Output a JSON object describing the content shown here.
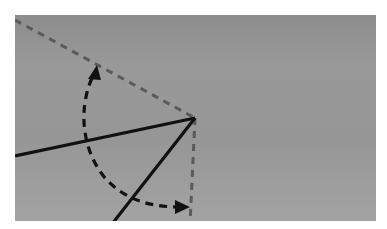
{
  "diagram": {
    "colors": {
      "background": "#ffffff",
      "panel": "#969696",
      "solid_line": "#111111",
      "dashed_reference": "#5a5a5a",
      "arc": "#111111"
    },
    "vertex": [
      195,
      118
    ],
    "elements": [
      {
        "id": "dashed-ref-upper",
        "type": "dashed-line",
        "from": [
          15,
          20
        ],
        "to": [
          195,
          118
        ]
      },
      {
        "id": "dashed-ref-vertical",
        "type": "dashed-line",
        "from": [
          195,
          118
        ],
        "to": [
          190,
          221
        ]
      },
      {
        "id": "solid-line-left",
        "type": "line",
        "from": [
          15,
          156
        ],
        "to": [
          195,
          118
        ]
      },
      {
        "id": "solid-line-lower",
        "type": "line",
        "from": [
          195,
          118
        ],
        "to": [
          113,
          221
        ]
      },
      {
        "id": "rotation-arc",
        "type": "dashed-arc",
        "from": [
          95,
          70
        ],
        "to": [
          188,
          207
        ],
        "arrowheads": "both"
      }
    ]
  }
}
